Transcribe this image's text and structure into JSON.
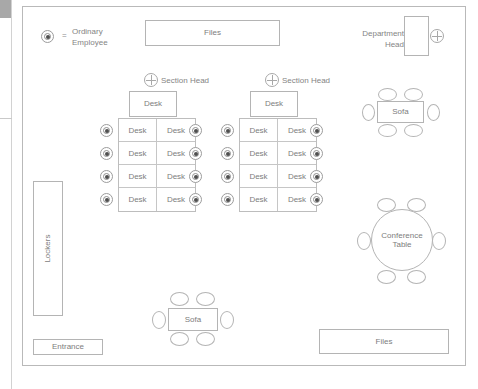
{
  "diagram": {
    "legend": {
      "symbol_name": "ordinary-employee-symbol",
      "equals": "=",
      "label_line1": "Ordinary",
      "label_line2": "Employee"
    },
    "colors": {
      "outline": "#b4b4b4",
      "room_outline": "#b9b9b9",
      "text": "#7d7d7d",
      "marker_fill": "#4f4f4f",
      "gutter_block": "#a8a8a8"
    },
    "labels": {
      "files_top": "Files",
      "files_bottom": "Files",
      "department_head_line1": "Department",
      "department_head_line2": "Head",
      "section_head_left": "Section Head",
      "section_head_right": "Section Head",
      "lockers": "Lockers",
      "entrance": "Entrance",
      "sofa_top": "Sofa",
      "sofa_bottom": "Sofa",
      "conference_line1": "Conference",
      "conference_line2": "Table",
      "desk": "Desk"
    },
    "clusters": [
      {
        "name": "left-desk-cluster",
        "head_desk_label": "Desk",
        "head_label": "Section Head",
        "rows": 4,
        "columns": 2,
        "desk_labels": [
          [
            "Desk",
            "Desk"
          ],
          [
            "Desk",
            "Desk"
          ],
          [
            "Desk",
            "Desk"
          ],
          [
            "Desk",
            "Desk"
          ]
        ],
        "employees_left": 4,
        "employees_right": 4
      },
      {
        "name": "right-desk-cluster",
        "head_desk_label": "Desk",
        "head_label": "Section Head",
        "rows": 4,
        "columns": 2,
        "desk_labels": [
          [
            "Desk",
            "Desk"
          ],
          [
            "Desk",
            "Desk"
          ],
          [
            "Desk",
            "Desk"
          ],
          [
            "Desk",
            "Desk"
          ]
        ],
        "employees_left": 4,
        "employees_right": 4
      }
    ],
    "furniture": {
      "sofa_top_chairs": 6,
      "sofa_bottom_chairs": 6,
      "conference_chairs": 6
    }
  }
}
